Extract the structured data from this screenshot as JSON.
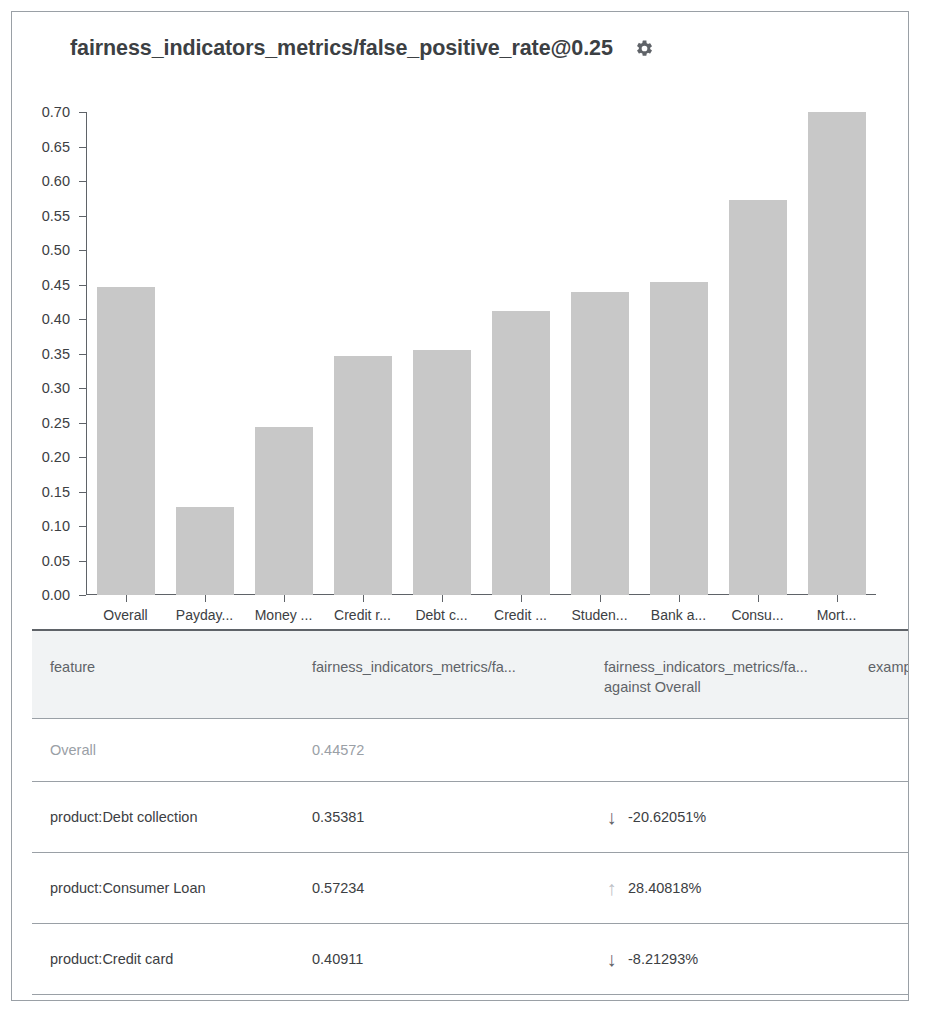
{
  "card": {
    "title": "fairness_indicators_metrics/false_positive_rate@0.25",
    "settings_icon": "gear-icon"
  },
  "chart_data": {
    "type": "bar",
    "title": "fairness_indicators_metrics/false_positive_rate@0.25",
    "xlabel": "",
    "ylabel": "",
    "ylim": [
      0.0,
      0.7
    ],
    "grid": false,
    "legend": null,
    "y_ticks": [
      "0.70",
      "0.65",
      "0.60",
      "0.55",
      "0.50",
      "0.45",
      "0.40",
      "0.35",
      "0.30",
      "0.25",
      "0.20",
      "0.15",
      "0.10",
      "0.05",
      "0.00"
    ],
    "categories": [
      "Overall",
      "Payday...",
      "Money ...",
      "Credit r...",
      "Debt c...",
      "Credit ...",
      "Studen...",
      "Bank a...",
      "Consu...",
      "Mort..."
    ],
    "values": [
      0.446,
      0.128,
      0.243,
      0.346,
      0.355,
      0.411,
      0.439,
      0.454,
      0.573,
      0.7
    ],
    "bar_color": "#c8c8c8"
  },
  "table": {
    "columns": [
      {
        "label": "feature"
      },
      {
        "label": "fairness_indicators_metrics/fa..."
      },
      {
        "label": "fairness_indicators_metrics/fa...",
        "sublabel": "against Overall"
      },
      {
        "label": "example_c"
      }
    ],
    "rows": [
      {
        "feature": "Overall",
        "metric": "0.44572",
        "arrow": "",
        "delta": "",
        "muted": true
      },
      {
        "feature": "product:Debt collection",
        "metric": "0.35381",
        "arrow": "down-arrow-icon",
        "arrow_glyph": "↓",
        "delta": "-20.62051%",
        "muted": false
      },
      {
        "feature": "product:Consumer Loan",
        "metric": "0.57234",
        "arrow": "up-arrow-icon",
        "arrow_glyph": "↑",
        "delta": "28.40818%",
        "muted": false
      },
      {
        "feature": "product:Credit card",
        "metric": "0.40911",
        "arrow": "down-arrow-icon",
        "arrow_glyph": "↓",
        "delta": "-8.21293%",
        "muted": false
      }
    ]
  },
  "colors": {
    "bar": "#c8c8c8",
    "axis": "#5f6368",
    "text": "#3c4043",
    "muted": "#9aa0a6",
    "header_bg": "#f1f3f4"
  }
}
